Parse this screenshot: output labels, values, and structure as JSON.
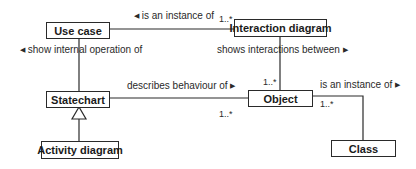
{
  "diagram": {
    "type": "UML class diagram (metamodel)",
    "nodes": {
      "use_case": "Use case",
      "interaction_diagram": "Interaction diagram",
      "statechart": "Statechart",
      "activity_diagram": "Activity diagram",
      "object": "Object",
      "class": "Class"
    },
    "associations": {
      "usecase_interaction": {
        "label": "is an instance of",
        "direction_glyph": "◀",
        "multiplicity_target": "1..*"
      },
      "usecase_statechart": {
        "label": "show internal operation of",
        "direction_glyph": "◀"
      },
      "interaction_object": {
        "label": "shows interactions between",
        "direction_glyph": "▶",
        "multiplicity_target": "1..*"
      },
      "statechart_object": {
        "label": "describes behaviour of",
        "direction_glyph": "▶",
        "multiplicity_target": "1..*"
      },
      "object_class": {
        "label": "is an instance of",
        "direction_glyph": "▶",
        "multiplicity_source": "1..*"
      }
    },
    "generalization": {
      "child": "Activity diagram",
      "parent": "Statechart"
    },
    "colors": {
      "line": "#2a2a2a",
      "background": "#ffffff",
      "text": "#1a1a1a"
    }
  }
}
